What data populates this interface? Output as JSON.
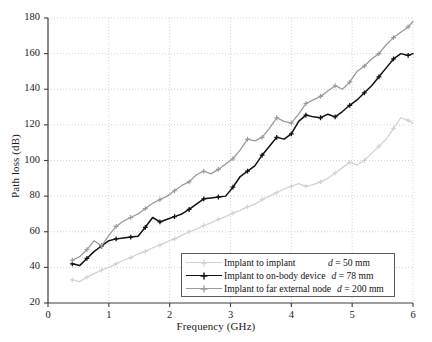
{
  "chart_data": {
    "type": "line",
    "title": "",
    "xlabel": "Frequency (GHz)",
    "ylabel": "Path loss (dB)",
    "xlim": [
      0,
      6
    ],
    "ylim": [
      20,
      180
    ],
    "xticks": [
      0,
      1,
      2,
      3,
      4,
      5,
      6
    ],
    "yticks": [
      20,
      40,
      60,
      80,
      100,
      120,
      140,
      160,
      180
    ],
    "grid": true,
    "legend_position": "bottom-right",
    "series": [
      {
        "name": "Implant to implant",
        "distance": "d = 50 mm",
        "color": "#d2d2d2",
        "marker": "plus",
        "x": [
          0.4,
          0.52,
          0.64,
          0.76,
          0.88,
          1.0,
          1.12,
          1.24,
          1.36,
          1.48,
          1.6,
          1.72,
          1.84,
          1.96,
          2.08,
          2.2,
          2.32,
          2.44,
          2.56,
          2.68,
          2.8,
          2.92,
          3.04,
          3.16,
          3.28,
          3.4,
          3.52,
          3.64,
          3.76,
          3.88,
          4.0,
          4.12,
          4.24,
          4.36,
          4.48,
          4.6,
          4.72,
          4.84,
          4.96,
          5.08,
          5.2,
          5.32,
          5.44,
          5.56,
          5.68,
          5.8,
          5.92,
          6.0
        ],
        "y": [
          33.0,
          32.0,
          34.5,
          36.5,
          38.5,
          40.0,
          42.0,
          44.0,
          45.5,
          47.5,
          49.0,
          51.0,
          52.5,
          54.5,
          56.0,
          58.0,
          60.0,
          61.5,
          63.5,
          65.0,
          67.0,
          68.5,
          70.5,
          72.0,
          74.0,
          75.5,
          78.0,
          80.0,
          82.0,
          84.0,
          85.5,
          87.0,
          85.5,
          86.5,
          88.0,
          90.0,
          93.0,
          96.0,
          99.0,
          97.5,
          100.0,
          104.0,
          108.0,
          112.0,
          118.0,
          124.0,
          122.5,
          121.0
        ]
      },
      {
        "name": "Implant to on-body device",
        "distance": "d = 78 mm",
        "color": "#111111",
        "marker": "plus",
        "x": [
          0.4,
          0.52,
          0.64,
          0.76,
          0.88,
          1.0,
          1.12,
          1.24,
          1.36,
          1.48,
          1.6,
          1.72,
          1.84,
          1.96,
          2.08,
          2.2,
          2.32,
          2.44,
          2.56,
          2.68,
          2.8,
          2.92,
          3.04,
          3.16,
          3.28,
          3.4,
          3.52,
          3.64,
          3.76,
          3.88,
          4.0,
          4.12,
          4.24,
          4.36,
          4.48,
          4.6,
          4.72,
          4.84,
          4.96,
          5.08,
          5.2,
          5.32,
          5.44,
          5.56,
          5.68,
          5.8,
          5.92,
          6.0
        ],
        "y": [
          42.0,
          41.0,
          45.0,
          49.0,
          52.0,
          55.0,
          56.0,
          56.5,
          57.0,
          57.5,
          62.5,
          68.0,
          65.5,
          67.0,
          68.5,
          70.0,
          72.5,
          75.5,
          78.5,
          79.0,
          79.5,
          80.0,
          85.0,
          91.0,
          94.0,
          97.0,
          103.0,
          108.0,
          113.0,
          112.0,
          115.0,
          122.0,
          125.5,
          124.5,
          124.0,
          126.0,
          124.5,
          127.5,
          131.0,
          134.0,
          138.0,
          142.0,
          147.0,
          152.0,
          157.0,
          160.0,
          159.0,
          160.0
        ]
      },
      {
        "name": "Implant to far external node",
        "distance": "d = 200 mm",
        "color": "#9a9a9a",
        "marker": "plus",
        "x": [
          0.4,
          0.52,
          0.64,
          0.76,
          0.88,
          1.0,
          1.12,
          1.24,
          1.36,
          1.48,
          1.6,
          1.72,
          1.84,
          1.96,
          2.08,
          2.2,
          2.32,
          2.44,
          2.56,
          2.68,
          2.8,
          2.92,
          3.04,
          3.16,
          3.28,
          3.4,
          3.52,
          3.64,
          3.76,
          3.88,
          4.0,
          4.12,
          4.24,
          4.36,
          4.48,
          4.6,
          4.72,
          4.84,
          4.96,
          5.08,
          5.2,
          5.32,
          5.44,
          5.56,
          5.68,
          5.8,
          5.92,
          6.0
        ],
        "y": [
          44.0,
          46.0,
          50.0,
          55.0,
          52.0,
          58.0,
          63.0,
          66.0,
          68.0,
          70.0,
          73.0,
          76.0,
          78.0,
          80.0,
          83.0,
          86.0,
          88.0,
          92.0,
          94.0,
          92.5,
          95.0,
          98.0,
          101.0,
          106.0,
          112.0,
          111.0,
          113.0,
          118.0,
          124.0,
          122.0,
          121.0,
          126.0,
          132.0,
          134.0,
          136.0,
          139.0,
          142.0,
          140.0,
          144.0,
          150.0,
          153.0,
          157.0,
          160.0,
          165.0,
          169.0,
          172.0,
          175.0,
          178.0
        ]
      }
    ]
  },
  "axes": {
    "frame_color": "#3c3c3c",
    "grid_color": "#c8c8c8"
  }
}
